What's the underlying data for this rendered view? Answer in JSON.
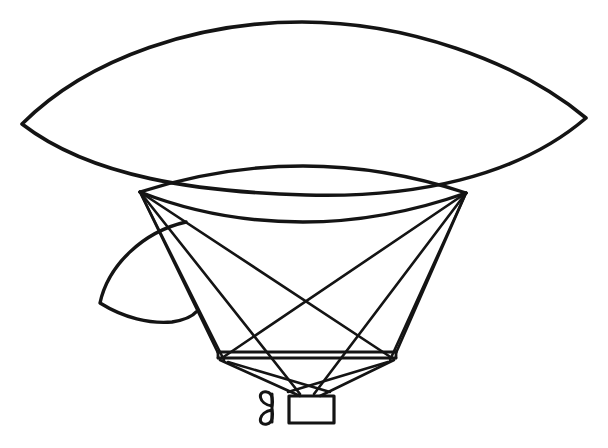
{
  "artwork": {
    "title": "Line drawing of a lenticular balloon airship",
    "subject": "airship",
    "style": "black ink line art on white background",
    "background_color": "#ffffff",
    "ink_color": "#141414",
    "canvas": {
      "width": 608,
      "height": 448
    }
  },
  "parts": [
    {
      "id": "envelope",
      "label": "Lens-shaped gas envelope (upper canopy)"
    },
    {
      "id": "inner-lens",
      "label": "Lower lens body of the envelope"
    },
    {
      "id": "rudder",
      "label": "Curved rudder fin at rear left"
    },
    {
      "id": "rigging",
      "label": "Suspension rigging lines"
    },
    {
      "id": "rail",
      "label": "Horizontal suspension rail"
    },
    {
      "id": "gondola",
      "label": "Gondola car"
    },
    {
      "id": "propeller",
      "label": "Two-blade propeller"
    }
  ],
  "geometry": {
    "envelope": {
      "left_tip": [
        22,
        124
      ],
      "right_tip": [
        586,
        118
      ],
      "top_apex": [
        302,
        22
      ],
      "outline_path": "M 22 124 C 90 56, 200 22, 302 22 C 404 22, 516 60, 586 118 C 516 178, 412 198, 306 195 C 200 192, 92 178, 22 124 Z"
    },
    "inner_lens": {
      "left_node": [
        140,
        192
      ],
      "right_node": [
        466,
        193
      ],
      "top_apex": [
        303,
        173
      ],
      "bottom_sag": [
        303,
        219
      ],
      "upper_path": "M 140 192 C 196 174, 248 166, 303 166 C 358 166, 412 175, 466 193",
      "lower_path": "M 140 192 C 196 214, 248 222, 303 222 C 358 222, 412 212, 466 193"
    },
    "rudder": {
      "apex": [
        186,
        222
      ],
      "left_point": [
        100,
        303
      ],
      "right_point": [
        196,
        312
      ],
      "path": "M 186 222 C 142 232, 108 266, 100 303 C 124 318, 150 324, 172 322 C 184 320, 192 317, 196 312"
    },
    "rail": {
      "left_end": [
        218,
        355
      ],
      "right_end": [
        396,
        355
      ],
      "thickness_px": 6
    },
    "gondola_box": {
      "x": 289,
      "y": 396,
      "width": 45,
      "height": 27
    },
    "propeller": {
      "hub": [
        272,
        408
      ],
      "blade_count": 2
    },
    "rigging_lines": [
      {
        "from": [
          140,
          192
        ],
        "to": [
          218,
          353
        ]
      },
      {
        "from": [
          140,
          192
        ],
        "to": [
          224,
          360
        ]
      },
      {
        "from": [
          140,
          192
        ],
        "to": [
          300,
          394
        ]
      },
      {
        "from": [
          140,
          192
        ],
        "to": [
          392,
          358
        ]
      },
      {
        "from": [
          466,
          193
        ],
        "to": [
          396,
          353
        ]
      },
      {
        "from": [
          466,
          193
        ],
        "to": [
          390,
          360
        ]
      },
      {
        "from": [
          466,
          193
        ],
        "to": [
          314,
          394
        ]
      },
      {
        "from": [
          466,
          193
        ],
        "to": [
          222,
          358
        ]
      },
      {
        "from": [
          220,
          360
        ],
        "to": [
          300,
          396
        ]
      },
      {
        "from": [
          394,
          360
        ],
        "to": [
          320,
          396
        ]
      },
      {
        "from": [
          228,
          362
        ],
        "to": [
          330,
          392
        ]
      },
      {
        "from": [
          388,
          362
        ],
        "to": [
          288,
          392
        ]
      }
    ]
  }
}
